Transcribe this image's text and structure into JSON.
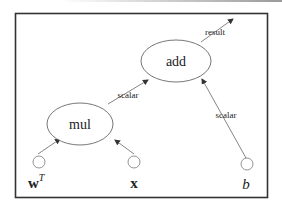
{
  "diagram": {
    "type": "computational-graph",
    "nodes": [
      {
        "id": "mul",
        "label": "mul",
        "kind": "operation"
      },
      {
        "id": "add",
        "label": "add",
        "kind": "operation"
      },
      {
        "id": "wT",
        "label_base": "w",
        "label_sup": "T",
        "kind": "input"
      },
      {
        "id": "x",
        "label": "x",
        "kind": "input"
      },
      {
        "id": "b",
        "label": "b",
        "kind": "input"
      }
    ],
    "edges": [
      {
        "from": "wT",
        "to": "mul",
        "label": ""
      },
      {
        "from": "x",
        "to": "mul",
        "label": ""
      },
      {
        "from": "mul",
        "to": "add",
        "label": "scalar"
      },
      {
        "from": "b",
        "to": "add",
        "label": "scalar"
      },
      {
        "from": "add",
        "to": "output",
        "label": "result"
      }
    ]
  },
  "labels": {
    "mul": "mul",
    "add": "add",
    "w": "w",
    "w_sup": "T",
    "x": "x",
    "b": "b",
    "edge_mul_add": "scalar",
    "edge_b_add": "scalar",
    "edge_result": "result"
  },
  "colors": {
    "frame": "#333333",
    "stroke": "#555555",
    "text": "#222222"
  }
}
